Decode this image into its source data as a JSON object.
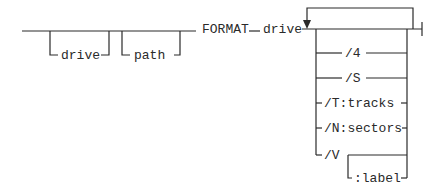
{
  "diagram": {
    "type": "syntax-railroad",
    "command": "FORMAT",
    "required_argument": "drive",
    "optional_prefix": [
      {
        "id": "drive",
        "label": "drive"
      },
      {
        "id": "path",
        "label": "path"
      }
    ],
    "repeatable_options": [
      {
        "id": "opt-4",
        "label": "/4"
      },
      {
        "id": "opt-s",
        "label": "/S"
      },
      {
        "id": "opt-t",
        "label": "/T:tracks"
      },
      {
        "id": "opt-n",
        "label": "/N:sectors"
      },
      {
        "id": "opt-v",
        "label": "/V"
      }
    ],
    "sub_option": {
      "parent": "/V",
      "label": ":label"
    },
    "stroke_color": "#2a2a2a",
    "background": "#ffffff"
  }
}
